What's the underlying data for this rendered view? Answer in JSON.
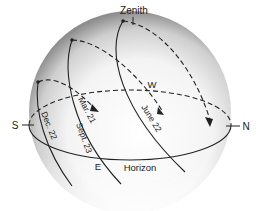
{
  "diagram": {
    "labels": {
      "zenith": "Zenith",
      "horizon": "Horizon",
      "north": "N",
      "south": "S",
      "east": "E",
      "west": "W"
    },
    "paths": [
      {
        "id": "dec22",
        "label": "Dec. 22"
      },
      {
        "id": "mar21",
        "label": "Mar. 21"
      },
      {
        "id": "sept23",
        "label": "Sept. 23"
      },
      {
        "id": "june22",
        "label": "June 22"
      }
    ],
    "colors": {
      "line": "#222222",
      "sphere_edge": "#9a9a9a",
      "sphere_center": "#ffffff",
      "background": "#ffffff"
    }
  }
}
